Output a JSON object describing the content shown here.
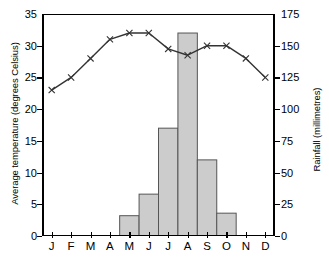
{
  "chart_data": {
    "type": "bar",
    "title": "",
    "subtitle": "",
    "categories": [
      "J",
      "F",
      "M",
      "A",
      "M",
      "J",
      "J",
      "A",
      "S",
      "O",
      "N",
      "D"
    ],
    "xlabel": "",
    "grid": false,
    "legend_position": "none",
    "series": [
      {
        "name": "Rainfall",
        "type": "bar",
        "axis": "right",
        "unit": "millimetres",
        "values": [
          0,
          0,
          0,
          0,
          16,
          33,
          85,
          160,
          60,
          18,
          0,
          0
        ]
      },
      {
        "name": "Average temperature",
        "type": "line",
        "axis": "left",
        "unit": "degrees Celsius",
        "marker": "x",
        "values": [
          23,
          25,
          28,
          31,
          32,
          32,
          29.5,
          28.5,
          30,
          30,
          28,
          25
        ]
      }
    ],
    "left_axis": {
      "label": "Average temperature (degrees Celsius)",
      "ticks": [
        0,
        5,
        10,
        15,
        20,
        25,
        30,
        35
      ],
      "tick_labels": [
        "0",
        "5",
        "10",
        "15",
        "20",
        "25",
        "30",
        "35"
      ],
      "ylim": [
        0,
        35
      ]
    },
    "right_axis": {
      "label": "Rainfall (millimetres)",
      "ticks": [
        0,
        25,
        50,
        75,
        100,
        125,
        150,
        175
      ],
      "tick_labels": [
        "0",
        "25",
        "50",
        "75",
        "100",
        "125",
        "150",
        "175"
      ],
      "ylim": [
        0,
        175
      ]
    },
    "colors": {
      "bar_fill": "#cccccc",
      "bar_stroke": "#555555",
      "line": "#333333",
      "axis": "#000000",
      "background": "#ffffff"
    }
  }
}
